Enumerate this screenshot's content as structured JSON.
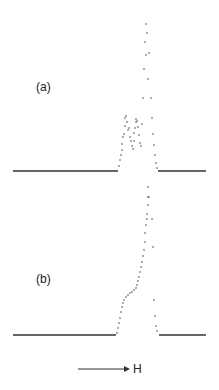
{
  "chart_data": [
    {
      "type": "scatter",
      "panel_label": "(a)",
      "title": "",
      "xlabel": "H",
      "ylabel": "",
      "grid": false,
      "legend": null,
      "baseline_y_px": 171,
      "baseline_left": {
        "x1": 13,
        "x2": 118
      },
      "baseline_right": {
        "x1": 158,
        "x2": 206
      },
      "points_px": [
        [
          119,
          166
        ],
        [
          120,
          160
        ],
        [
          121,
          155
        ],
        [
          122,
          150
        ],
        [
          122,
          144
        ],
        [
          123,
          137
        ],
        [
          124,
          134
        ],
        [
          125,
          126
        ],
        [
          125,
          118
        ],
        [
          126,
          116
        ],
        [
          127,
          122
        ],
        [
          128,
          130
        ],
        [
          129,
          128
        ],
        [
          130,
          137
        ],
        [
          131,
          141
        ],
        [
          132,
          146
        ],
        [
          133,
          149
        ],
        [
          134,
          141
        ],
        [
          134,
          133
        ],
        [
          135,
          128
        ],
        [
          136,
          122
        ],
        [
          136,
          119
        ],
        [
          137,
          121
        ],
        [
          138,
          127
        ],
        [
          139,
          135
        ],
        [
          140,
          143
        ],
        [
          141,
          146
        ],
        [
          142,
          124
        ],
        [
          143,
          98
        ],
        [
          144,
          69
        ],
        [
          145,
          42
        ],
        [
          146,
          55
        ],
        [
          146,
          24
        ],
        [
          147,
          33
        ],
        [
          148,
          79
        ],
        [
          149,
          53
        ],
        [
          151,
          98
        ],
        [
          152,
          118
        ],
        [
          153,
          134
        ],
        [
          154,
          145
        ],
        [
          155,
          155
        ],
        [
          156,
          163
        ],
        [
          157,
          168
        ],
        [
          148,
          187
        ],
        [
          149,
          197
        ]
      ]
    },
    {
      "type": "scatter",
      "panel_label": "(b)",
      "title": "",
      "xlabel": "H",
      "ylabel": "",
      "grid": false,
      "legend": null,
      "baseline_y_px": 335,
      "baseline_left": {
        "x1": 13,
        "x2": 116
      },
      "baseline_right": {
        "x1": 159,
        "x2": 206
      },
      "points_px": [
        [
          117,
          333
        ],
        [
          118,
          328
        ],
        [
          119,
          323
        ],
        [
          120,
          318
        ],
        [
          121,
          312
        ],
        [
          122,
          307
        ],
        [
          123,
          303
        ],
        [
          124,
          300
        ],
        [
          126,
          297
        ],
        [
          128,
          295
        ],
        [
          130,
          293
        ],
        [
          132,
          292
        ],
        [
          134,
          290
        ],
        [
          136,
          288
        ],
        [
          137,
          285
        ],
        [
          138,
          281
        ],
        [
          139,
          277
        ],
        [
          140,
          272
        ],
        [
          141,
          267
        ],
        [
          142,
          262
        ],
        [
          143,
          256
        ],
        [
          144,
          250
        ],
        [
          145,
          242
        ],
        [
          145,
          233
        ],
        [
          146,
          225
        ],
        [
          147,
          219
        ],
        [
          147,
          214
        ],
        [
          148,
          205
        ],
        [
          148,
          197
        ],
        [
          152,
          219
        ],
        [
          153,
          247
        ],
        [
          154,
          300
        ],
        [
          155,
          316
        ],
        [
          156,
          326
        ],
        [
          157,
          331
        ]
      ]
    }
  ],
  "labels": {
    "panel_a": "(a)",
    "panel_b": "(b)",
    "field_direction": "H"
  },
  "arrow": {
    "x1": 78,
    "x2": 130,
    "y": 369
  },
  "colors": {
    "ink": "#333333",
    "background": "#ffffff"
  }
}
